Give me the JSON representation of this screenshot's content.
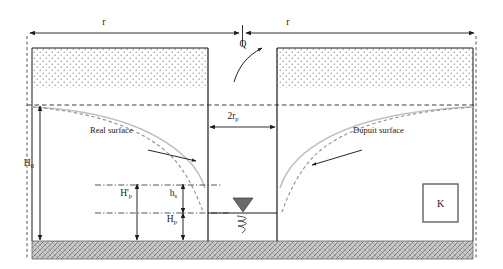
{
  "figure": {
    "labels": {
      "radius_left": "r",
      "radius_right": "r",
      "discharge": "Q",
      "well_diameter": "2r",
      "well_diameter_sub": "p",
      "total_head": "H",
      "total_head_sub": "0",
      "seepage_head": "H'",
      "seepage_head_sub": "p",
      "seepage_face": "h",
      "seepage_face_sub": "s",
      "well_head": "H",
      "well_head_sub": "p",
      "real_surface": "Real surface",
      "dupuit_surface": "Dupuit surface",
      "conductivity": "K"
    },
    "colors": {
      "line": "#1a1a1a",
      "dupuit_curve": "#b8b8b8",
      "real_curve": "#8a8a8a",
      "bedrock_fill": "#b5b5b5",
      "stipple": "#7a7a7a",
      "water_marker": "#666666",
      "box_border": "#555555"
    },
    "icons": {
      "water_table_marker": "filled-down-triangle",
      "water_squiggle": "coil-squiggle",
      "discharge_arrow": "curved-up-right-arrow"
    }
  }
}
